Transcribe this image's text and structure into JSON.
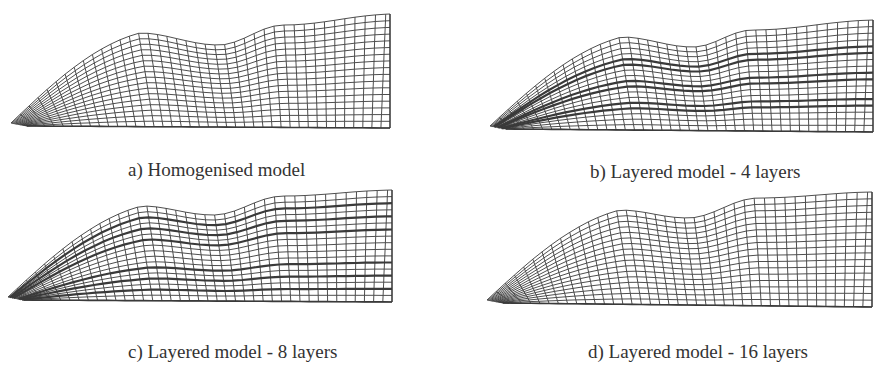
{
  "figure": {
    "background": "#ffffff",
    "line_color": "#3a3a3a",
    "caption_color": "#333333",
    "panels": [
      {
        "id": "a",
        "caption": "a) Homogenised model",
        "caption_pos": [
          128,
          160
        ],
        "layers": 0,
        "mesh": {
          "left_tip": [
            27,
            123
          ],
          "peak": [
            155,
            33
          ],
          "dip": [
            230,
            45
          ],
          "shoulder": [
            290,
            25
          ],
          "top_right": [
            390,
            14
          ],
          "bottom_right": [
            390,
            128
          ],
          "bottom_left": [
            35,
            128
          ],
          "cols": 40,
          "rows": 17
        }
      },
      {
        "id": "b",
        "caption": "b) Layered model - 4 layers",
        "caption_pos": [
          590,
          162
        ],
        "layers": 4,
        "mesh": {
          "left_tip": [
            506,
            126
          ],
          "peak": [
            637,
            37
          ],
          "dip": [
            705,
            47
          ],
          "shoulder": [
            760,
            30
          ],
          "top_right": [
            873,
            20
          ],
          "bottom_right": [
            873,
            132
          ],
          "bottom_left": [
            512,
            130
          ],
          "cols": 40,
          "rows": 17
        }
      },
      {
        "id": "c",
        "caption": "c) Layered model - 8 layers",
        "caption_pos": [
          128,
          342
        ],
        "layers": 8,
        "mesh": {
          "left_tip": [
            24,
            297
          ],
          "peak": [
            157,
            206
          ],
          "dip": [
            225,
            215
          ],
          "shoulder": [
            290,
            196
          ],
          "top_right": [
            392,
            190
          ],
          "bottom_right": [
            392,
            302
          ],
          "bottom_left": [
            30,
            301
          ],
          "cols": 40,
          "rows": 17
        }
      },
      {
        "id": "d",
        "caption": "d) Layered model - 16 layers",
        "caption_pos": [
          588,
          342
        ],
        "layers": 16,
        "mesh": {
          "left_tip": [
            503,
            300
          ],
          "peak": [
            635,
            210
          ],
          "dip": [
            700,
            218
          ],
          "shoulder": [
            765,
            198
          ],
          "top_right": [
            872,
            192
          ],
          "bottom_right": [
            872,
            307
          ],
          "bottom_left": [
            510,
            304
          ],
          "cols": 40,
          "rows": 17
        }
      }
    ]
  }
}
